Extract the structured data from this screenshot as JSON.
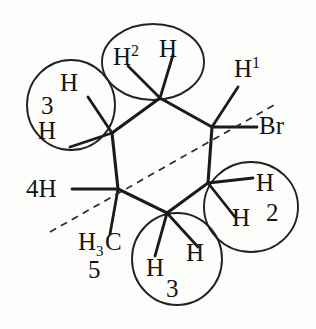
{
  "figure": {
    "type": "chemical-structure",
    "canvas": {
      "width": 316,
      "height": 329
    },
    "background_color": "#fdfdfb",
    "bond_color": "#1b1b1b",
    "circle_color": "#222222",
    "plane_line_color": "#2a2a2a"
  },
  "ring": {
    "name": "cyclohexane-ring",
    "vertices": [
      {
        "id": "C-top",
        "x": 160,
        "y": 98
      },
      {
        "id": "C-upper-right",
        "x": 212,
        "y": 127
      },
      {
        "id": "C-lower-right",
        "x": 208,
        "y": 183
      },
      {
        "id": "C-bottom",
        "x": 167,
        "y": 213
      },
      {
        "id": "C-lower-left",
        "x": 118,
        "y": 189
      },
      {
        "id": "C-upper-left",
        "x": 112,
        "y": 133
      }
    ]
  },
  "plane_line": {
    "name": "mirror-plane-dashed-line",
    "x1": 50,
    "y1": 232,
    "x2": 276,
    "y2": 104
  },
  "highlight_circles": [
    {
      "name": "circle-h2-top",
      "cx": 153,
      "cy": 62,
      "rx": 51,
      "ry": 38
    },
    {
      "name": "circle-h3-upper-left",
      "cx": 71,
      "cy": 105,
      "rx": 44,
      "ry": 45
    },
    {
      "name": "circle-h2-lower-right",
      "cx": 251,
      "cy": 207,
      "rx": 47,
      "ry": 45
    },
    {
      "name": "circle-h3-bottom",
      "cx": 177,
      "cy": 259,
      "rx": 45,
      "ry": 46
    }
  ],
  "bonds": [
    {
      "name": "bond-top-to-h2a",
      "x1": 160,
      "y1": 98,
      "x2": 128,
      "y2": 66
    },
    {
      "name": "bond-top-to-h2b",
      "x1": 160,
      "y1": 98,
      "x2": 173,
      "y2": 55
    },
    {
      "name": "bond-upper-right-to-h1",
      "x1": 212,
      "y1": 127,
      "x2": 238,
      "y2": 87
    },
    {
      "name": "bond-upper-right-to-br",
      "x1": 212,
      "y1": 127,
      "x2": 257,
      "y2": 127
    },
    {
      "name": "bond-upper-left-to-h3a",
      "x1": 112,
      "y1": 133,
      "x2": 88,
      "y2": 97
    },
    {
      "name": "bond-upper-left-to-h3b",
      "x1": 112,
      "y1": 133,
      "x2": 70,
      "y2": 147
    },
    {
      "name": "bond-lower-left-to-h4",
      "x1": 118,
      "y1": 189,
      "x2": 72,
      "y2": 189
    },
    {
      "name": "bond-lower-left-to-ch3",
      "x1": 118,
      "y1": 189,
      "x2": 110,
      "y2": 234
    },
    {
      "name": "bond-bottom-to-h3a",
      "x1": 167,
      "y1": 213,
      "x2": 155,
      "y2": 256
    },
    {
      "name": "bond-bottom-to-h3b",
      "x1": 167,
      "y1": 213,
      "x2": 198,
      "y2": 247
    },
    {
      "name": "bond-lower-right-to-h2a",
      "x1": 208,
      "y1": 183,
      "x2": 253,
      "y2": 178
    },
    {
      "name": "bond-lower-right-to-h2b",
      "x1": 208,
      "y1": 183,
      "x2": 235,
      "y2": 217
    }
  ],
  "labels": [
    {
      "name": "label-h2-left",
      "text": "H",
      "sup": "2",
      "sub": "",
      "x": 113,
      "y": 44,
      "group": "top-circle"
    },
    {
      "name": "label-h2-right",
      "text": "H",
      "sup": "",
      "sub": "",
      "x": 159,
      "y": 36,
      "group": "top-circle"
    },
    {
      "name": "label-h3-top",
      "text": "H",
      "sup": "",
      "sub": "",
      "x": 60,
      "y": 70,
      "group": "upper-left-circle"
    },
    {
      "name": "label-3-left",
      "text": "3",
      "sup": "",
      "sub": "",
      "x": 41,
      "y": 93,
      "group": "upper-left-circle"
    },
    {
      "name": "label-h3-bottom",
      "text": "H",
      "sup": "",
      "sub": "",
      "x": 38,
      "y": 118,
      "group": "upper-left-circle"
    },
    {
      "name": "label-h1",
      "text": "H",
      "sup": "1",
      "sub": "",
      "x": 234,
      "y": 56,
      "group": "right"
    },
    {
      "name": "label-br",
      "text": "Br",
      "sup": "",
      "sub": "",
      "x": 259,
      "y": 113,
      "group": "right"
    },
    {
      "name": "label-h2-lr-top",
      "text": "H",
      "sup": "",
      "sub": "",
      "x": 256,
      "y": 170,
      "group": "lower-right-circle"
    },
    {
      "name": "label-h2-lr-bottom",
      "text": "H",
      "sup": "",
      "sub": "",
      "x": 232,
      "y": 205,
      "group": "lower-right-circle"
    },
    {
      "name": "label-2-lr",
      "text": "2",
      "sup": "",
      "sub": "",
      "x": 266,
      "y": 200,
      "group": "lower-right-circle"
    },
    {
      "name": "label-4h",
      "text": "4H",
      "sup": "",
      "sub": "",
      "x": 26,
      "y": 176,
      "group": "left"
    },
    {
      "name": "label-h3c",
      "text": "H",
      "sup": "",
      "sub": "3",
      "x": 78,
      "y": 229,
      "group": "methyl"
    },
    {
      "name": "label-c-methyl",
      "text": "C",
      "sup": "",
      "sub": "",
      "x": 105,
      "y": 229,
      "group": "methyl"
    },
    {
      "name": "label-5",
      "text": "5",
      "sup": "",
      "sub": "",
      "x": 88,
      "y": 257,
      "group": "methyl"
    },
    {
      "name": "label-h3-bot-left",
      "text": "H",
      "sup": "",
      "sub": "",
      "x": 146,
      "y": 255,
      "group": "bottom-circle"
    },
    {
      "name": "label-h3-bot-right",
      "text": "H",
      "sup": "",
      "sub": "",
      "x": 186,
      "y": 240,
      "group": "bottom-circle"
    },
    {
      "name": "label-3-bottom",
      "text": "3",
      "sup": "",
      "sub": "",
      "x": 166,
      "y": 276,
      "group": "bottom-circle"
    }
  ]
}
